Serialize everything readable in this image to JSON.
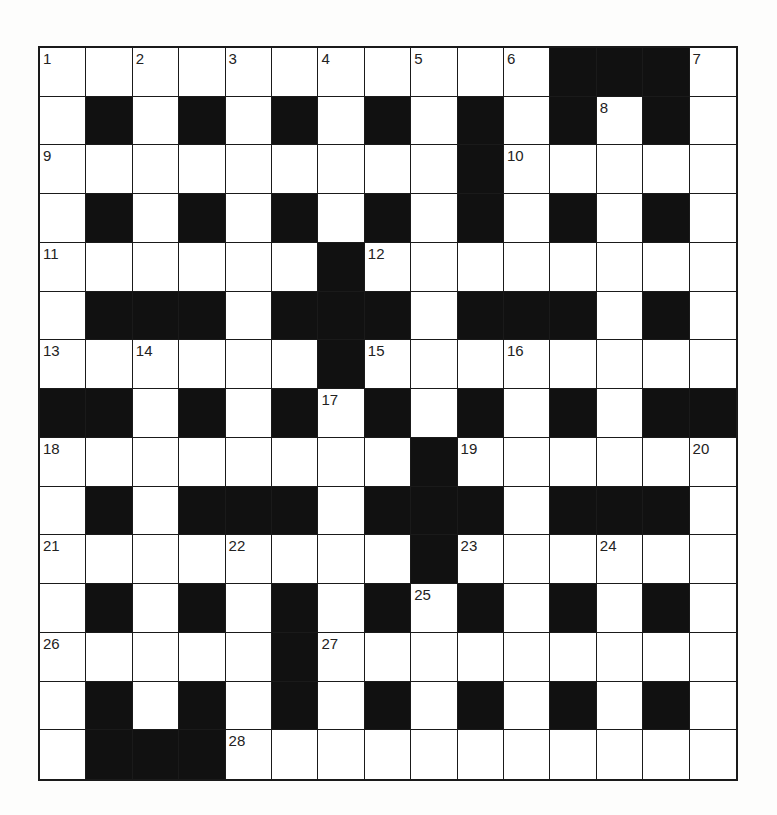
{
  "puzzle": {
    "rows": 15,
    "cols": 15,
    "grid": [
      "...........###.",
      ".#.#.#.#.#.#.#.",
      ".........#.....",
      ".#.#.#.#.#.#.#.",
      "......#........",
      ".###.###.###.#.",
      "......#........",
      "##.#.#.#.#.#.##",
      "........#......",
      ".#.###.###.###.",
      "........#......",
      ".#.#.#.#.#.#.#.",
      ".....#.........",
      ".#.#.#.#.#.#.#.",
      ".###..........."
    ],
    "numbers": [
      {
        "n": "1",
        "r": 0,
        "c": 0
      },
      {
        "n": "2",
        "r": 0,
        "c": 2
      },
      {
        "n": "3",
        "r": 0,
        "c": 4
      },
      {
        "n": "4",
        "r": 0,
        "c": 6
      },
      {
        "n": "5",
        "r": 0,
        "c": 8
      },
      {
        "n": "6",
        "r": 0,
        "c": 10
      },
      {
        "n": "7",
        "r": 0,
        "c": 14
      },
      {
        "n": "8",
        "r": 1,
        "c": 12
      },
      {
        "n": "9",
        "r": 2,
        "c": 0
      },
      {
        "n": "10",
        "r": 2,
        "c": 10
      },
      {
        "n": "11",
        "r": 4,
        "c": 0
      },
      {
        "n": "12",
        "r": 4,
        "c": 7
      },
      {
        "n": "13",
        "r": 6,
        "c": 0
      },
      {
        "n": "14",
        "r": 6,
        "c": 2
      },
      {
        "n": "15",
        "r": 6,
        "c": 7
      },
      {
        "n": "16",
        "r": 6,
        "c": 10
      },
      {
        "n": "17",
        "r": 7,
        "c": 6
      },
      {
        "n": "18",
        "r": 8,
        "c": 0
      },
      {
        "n": "19",
        "r": 8,
        "c": 9
      },
      {
        "n": "20",
        "r": 8,
        "c": 14
      },
      {
        "n": "21",
        "r": 10,
        "c": 0
      },
      {
        "n": "22",
        "r": 10,
        "c": 4
      },
      {
        "n": "23",
        "r": 10,
        "c": 9
      },
      {
        "n": "24",
        "r": 10,
        "c": 12
      },
      {
        "n": "25",
        "r": 11,
        "c": 8
      },
      {
        "n": "26",
        "r": 12,
        "c": 0
      },
      {
        "n": "27",
        "r": 12,
        "c": 6
      },
      {
        "n": "28",
        "r": 14,
        "c": 4
      }
    ],
    "letters": {},
    "colors": {
      "block": "#111111",
      "cell": "#ffffff",
      "line": "#1a1a1a"
    }
  }
}
